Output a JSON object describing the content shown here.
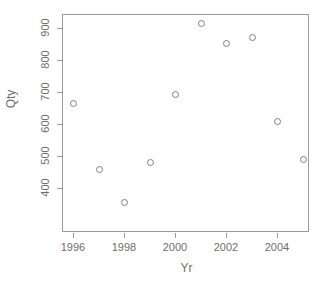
{
  "chart_data": {
    "type": "scatter",
    "title": "",
    "xlabel": "Yr",
    "ylabel": "Qty",
    "x": [
      1996,
      1997,
      1998,
      1999,
      2000,
      2001,
      2002,
      2003,
      2004,
      2005
    ],
    "values": [
      665,
      460,
      355,
      480,
      695,
      915,
      853,
      873,
      610,
      492
    ],
    "series": [
      {
        "name": "Qty",
        "points": [
          {
            "x": 1996,
            "y": 665
          },
          {
            "x": 1997,
            "y": 460
          },
          {
            "x": 1998,
            "y": 355
          },
          {
            "x": 1999,
            "y": 480
          },
          {
            "x": 2000,
            "y": 695
          },
          {
            "x": 2001,
            "y": 915
          },
          {
            "x": 2002,
            "y": 853
          },
          {
            "x": 2003,
            "y": 873
          },
          {
            "x": 2004,
            "y": 610
          },
          {
            "x": 2005,
            "y": 492
          }
        ]
      }
    ],
    "xlim": [
      1995.5,
      2005.5
    ],
    "ylim": [
      330,
      928
    ],
    "xticks": [
      1996,
      1998,
      2000,
      2002,
      2004
    ],
    "xtick_labels": [
      "1996",
      "1998",
      "2000",
      "2002",
      "2004"
    ],
    "yticks": [
      400,
      500,
      600,
      700,
      800,
      900
    ],
    "ytick_labels": [
      "400",
      "500",
      "600",
      "700",
      "800",
      "900"
    ],
    "grid": false,
    "legend": null,
    "marker": "open-circle",
    "marker_color": "#7d7d7d",
    "axis_color": "#9a9a9a",
    "text_color": "#6e6e6e",
    "background": "#ffffff"
  }
}
